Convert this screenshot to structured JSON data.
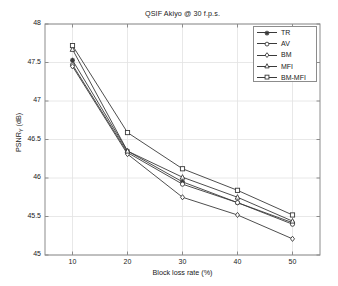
{
  "chart_data": {
    "type": "line",
    "title": "QSIF Akiyo @ 30 f.p.s.",
    "xlabel": "Block loss rate (%)",
    "ylabel": "PSNR_Y (dB)",
    "ylabel_main": "PSNR",
    "ylabel_sub": "Y",
    "ylabel_unit": " (dB)",
    "x": [
      10,
      20,
      30,
      40,
      50
    ],
    "xlim": [
      5,
      55
    ],
    "ylim": [
      45,
      48
    ],
    "xticks": [
      "10",
      "20",
      "30",
      "40",
      "50"
    ],
    "yticks": [
      "45",
      "45.5",
      "46",
      "46.5",
      "47",
      "47.5",
      "48"
    ],
    "ytick_values": [
      45,
      45.5,
      46,
      46.5,
      47,
      47.5,
      48
    ],
    "grid": true,
    "legend_position": "top-right",
    "series": [
      {
        "name": "TR",
        "marker": "star",
        "values": [
          47.53,
          46.35,
          45.95,
          45.68,
          45.42
        ]
      },
      {
        "name": "AV",
        "marker": "circle",
        "values": [
          47.47,
          46.33,
          45.92,
          45.68,
          45.4
        ]
      },
      {
        "name": "BM",
        "marker": "diamond",
        "values": [
          47.45,
          46.31,
          45.75,
          45.52,
          45.21
        ]
      },
      {
        "name": "MFI",
        "marker": "triangle",
        "values": [
          47.67,
          46.35,
          46.01,
          45.75,
          45.44
        ]
      },
      {
        "name": "BM-MFI",
        "marker": "square",
        "values": [
          47.72,
          46.59,
          46.12,
          45.84,
          45.52
        ]
      }
    ]
  },
  "colors": {
    "line": "#3a3a3a",
    "grid": "#e2e2e2",
    "axis": "#8c8c8c",
    "text": "#1a1a1a",
    "background": "#ffffff"
  }
}
